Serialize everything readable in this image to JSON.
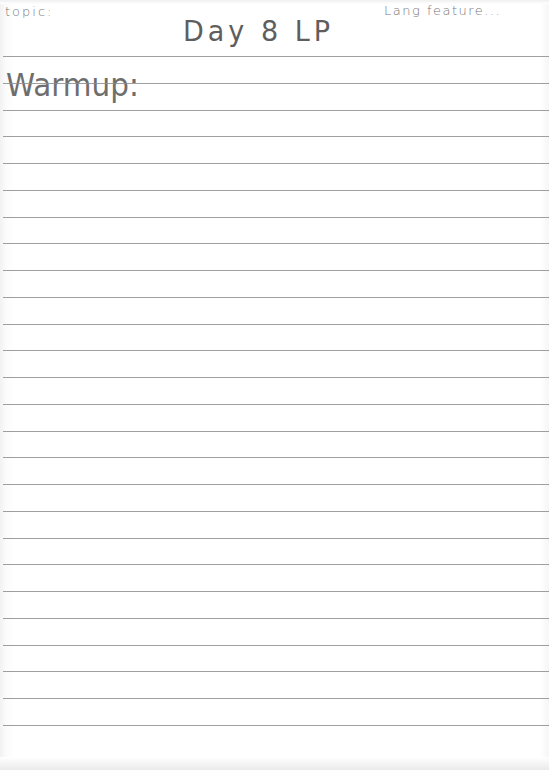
{
  "page": {
    "type": "lined notebook paper",
    "paper_color": "#ffffff",
    "rule_color": "#8e8e8e",
    "ink_color": "#6a6a6a",
    "rule_count": 26
  },
  "header": {
    "topic_label": "topic:",
    "title": "Day 8 LP",
    "corner_note": "Lang feature..."
  },
  "body": {
    "section_label": "Warmup:"
  }
}
